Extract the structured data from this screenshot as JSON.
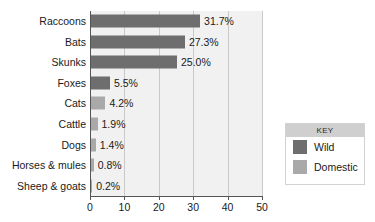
{
  "chart_data": {
    "type": "bar",
    "orientation": "horizontal",
    "title": "",
    "xlabel": "",
    "ylabel": "",
    "xlim": [
      0,
      50
    ],
    "xticks": [
      0,
      10,
      20,
      30,
      40,
      50
    ],
    "xtick_labels": [
      "0",
      "10",
      "20",
      "30",
      "40",
      "50"
    ],
    "grid": true,
    "grid_axis": "x",
    "legend_position": "right",
    "categories": [
      "Raccoons",
      "Bats",
      "Skunks",
      "Foxes",
      "Cats",
      "Cattle",
      "Dogs",
      "Horses & mules",
      "Sheep & goats"
    ],
    "values": [
      31.7,
      27.3,
      25.0,
      5.5,
      4.2,
      1.9,
      1.4,
      0.8,
      0.2
    ],
    "data_labels": [
      "31.7%",
      "27.3%",
      "25.0%",
      "5.5%",
      "4.2%",
      "1.9%",
      "1.4%",
      "0.8%",
      "0.2%"
    ],
    "groups": [
      "Wild",
      "Wild",
      "Wild",
      "Wild",
      "Domestic",
      "Domestic",
      "Domestic",
      "Domestic",
      "Domestic"
    ],
    "series": [
      {
        "name": "Wild",
        "color": "#6e6e6e",
        "points": [
          {
            "category": "Raccoons",
            "value": 31.7,
            "label": "31.7%"
          },
          {
            "category": "Bats",
            "value": 27.3,
            "label": "27.3%"
          },
          {
            "category": "Skunks",
            "value": 25.0,
            "label": "25.0%"
          },
          {
            "category": "Foxes",
            "value": 5.5,
            "label": "5.5%"
          }
        ]
      },
      {
        "name": "Domestic",
        "color": "#a9a9a9",
        "points": [
          {
            "category": "Cats",
            "value": 4.2,
            "label": "4.2%"
          },
          {
            "category": "Cattle",
            "value": 1.9,
            "label": "1.9%"
          },
          {
            "category": "Dogs",
            "value": 1.4,
            "label": "1.4%"
          },
          {
            "category": "Horses & mules",
            "value": 0.8,
            "label": "0.8%"
          },
          {
            "category": "Sheep & goats",
            "value": 0.2,
            "label": "0.2%"
          }
        ]
      }
    ]
  },
  "rows": [
    {
      "label": "Raccoons",
      "value": 31.7,
      "data_label": "31.7%",
      "group": "wild"
    },
    {
      "label": "Bats",
      "value": 27.3,
      "data_label": "27.3%",
      "group": "wild"
    },
    {
      "label": "Skunks",
      "value": 25.0,
      "data_label": "25.0%",
      "group": "wild"
    },
    {
      "label": "Foxes",
      "value": 5.5,
      "data_label": "5.5%",
      "group": "wild"
    },
    {
      "label": "Cats",
      "value": 4.2,
      "data_label": "4.2%",
      "group": "domestic"
    },
    {
      "label": "Cattle",
      "value": 1.9,
      "data_label": "1.9%",
      "group": "domestic"
    },
    {
      "label": "Dogs",
      "value": 1.4,
      "data_label": "1.4%",
      "group": "domestic"
    },
    {
      "label": "Horses & mules",
      "value": 0.8,
      "data_label": "0.8%",
      "group": "domestic"
    },
    {
      "label": "Sheep & goats",
      "value": 0.2,
      "data_label": "0.2%",
      "group": "domestic"
    }
  ],
  "axis": {
    "ticks": [
      {
        "value": 0,
        "label": "0"
      },
      {
        "value": 10,
        "label": "10"
      },
      {
        "value": 20,
        "label": "20"
      },
      {
        "value": 30,
        "label": "30"
      },
      {
        "value": 40,
        "label": "40"
      },
      {
        "value": 50,
        "label": "50"
      }
    ],
    "min": 0,
    "max": 50
  },
  "legend": {
    "title": "KEY",
    "entries": [
      {
        "label": "Wild",
        "color": "#6e6e6e",
        "group": "wild"
      },
      {
        "label": "Domestic",
        "color": "#a9a9a9",
        "group": "domestic"
      }
    ]
  },
  "colors": {
    "wild": "#6e6e6e",
    "domestic": "#a9a9a9",
    "plot_background": "#f1f1f1",
    "gridline": "#c9c9c9",
    "axis": "#555555",
    "legend_band": "#cfcfcf"
  }
}
